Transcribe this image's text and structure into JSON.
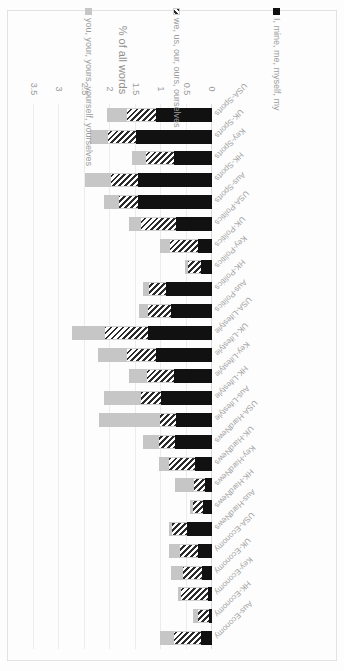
{
  "chart_data": {
    "type": "bar",
    "subtype": "stacked-horizontal",
    "title": "",
    "xlabel": "% of all words",
    "ylabel": "",
    "orientation": "horizontal",
    "rotated_180": true,
    "grid": true,
    "legend_position": "bottom",
    "xlim": [
      0,
      3.5
    ],
    "ticks": [
      "0",
      "0.5",
      "1",
      "1.5",
      "2",
      "2.5",
      "3",
      "3.5"
    ],
    "tick_values": [
      0,
      0.5,
      1,
      1.5,
      2,
      2.5,
      3,
      3.5
    ],
    "categories": [
      "Aus-Economy",
      "HK-Economy",
      "Key-Economy",
      "UK-Economy",
      "USA-Economy",
      "Aus-HardNews",
      "HK-HardNews",
      "Key-HardNews",
      "UK-HardNews",
      "USA-HardNews",
      "Aus-Lifestyle",
      "HK-Lifestyle",
      "Key-Lifestyle",
      "UK-Lifestyle",
      "USA-Lifestyle",
      "Aus-Politics",
      "HK-Politics",
      "Key-Politics",
      "UK-Politics",
      "USA-Politics",
      "Aus-Sports",
      "HK-Sports",
      "Key-Sports",
      "UK-Sports",
      "USA-Sports"
    ],
    "series": [
      {
        "name": "I, mine, me, myself, my",
        "color": "#111111",
        "pattern": "solid",
        "values": [
          0.22,
          0.06,
          0.07,
          0.2,
          0.28,
          0.5,
          0.17,
          0.13,
          0.33,
          0.72,
          0.7,
          1.0,
          0.75,
          1.1,
          1.25,
          0.8,
          0.9,
          0.22,
          0.28,
          0.7,
          1.45,
          1.45,
          0.75,
          1.5,
          1.1
        ]
      },
      {
        "name": "we, us, our, ours, ourselves",
        "color": "#2b2b2b",
        "pattern": "diagonal-hatch",
        "values": [
          0.52,
          0.22,
          0.53,
          0.37,
          0.35,
          0.28,
          0.2,
          0.22,
          0.52,
          0.33,
          0.33,
          0.4,
          0.52,
          0.57,
          0.85,
          0.45,
          0.33,
          0.25,
          0.55,
          0.7,
          0.38,
          0.53,
          0.55,
          0.55,
          0.57
        ]
      },
      {
        "name": "you, your, yours, yourself, yourselves",
        "color": "#c6c6c6",
        "pattern": "solid",
        "values": [
          0.28,
          0.1,
          0.06,
          0.23,
          0.21,
          0.07,
          0.06,
          0.37,
          0.19,
          0.3,
          1.2,
          0.72,
          0.37,
          0.57,
          0.65,
          0.19,
          0.12,
          0.07,
          0.2,
          0.23,
          0.3,
          0.52,
          0.27,
          0.35,
          0.4
        ]
      }
    ]
  },
  "axis": {
    "title": "% of all words"
  },
  "legend": {
    "items": [
      {
        "label": "I, mine, me, myself, my"
      },
      {
        "label": "we, us, our, ours, ourselves"
      },
      {
        "label": "you, your, yours, yourself, yourselves"
      }
    ]
  }
}
